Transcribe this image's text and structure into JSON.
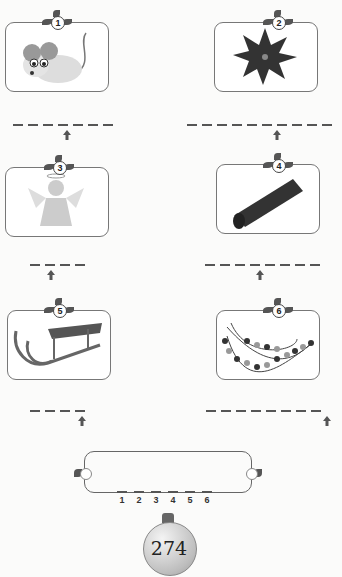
{
  "puzzles": [
    {
      "number": "1",
      "picture": "mouse",
      "blanks": 7,
      "arrow_at": 4
    },
    {
      "number": "2",
      "picture": "poinsettia",
      "blanks": 10,
      "arrow_at": 6
    },
    {
      "number": "3",
      "picture": "angel",
      "blanks": 4,
      "arrow_at": 2
    },
    {
      "number": "4",
      "picture": "cinnamon-stick",
      "blanks": 8,
      "arrow_at": 4
    },
    {
      "number": "5",
      "picture": "sled",
      "blanks": 4,
      "arrow_at": 4
    },
    {
      "number": "6",
      "picture": "garland",
      "blanks": 8,
      "arrow_at": 8
    }
  ],
  "answer": {
    "slots": [
      "1",
      "2",
      "3",
      "4",
      "5",
      "6"
    ]
  },
  "page_number": "274",
  "colors": {
    "line": "#555555",
    "border": "#777777"
  }
}
